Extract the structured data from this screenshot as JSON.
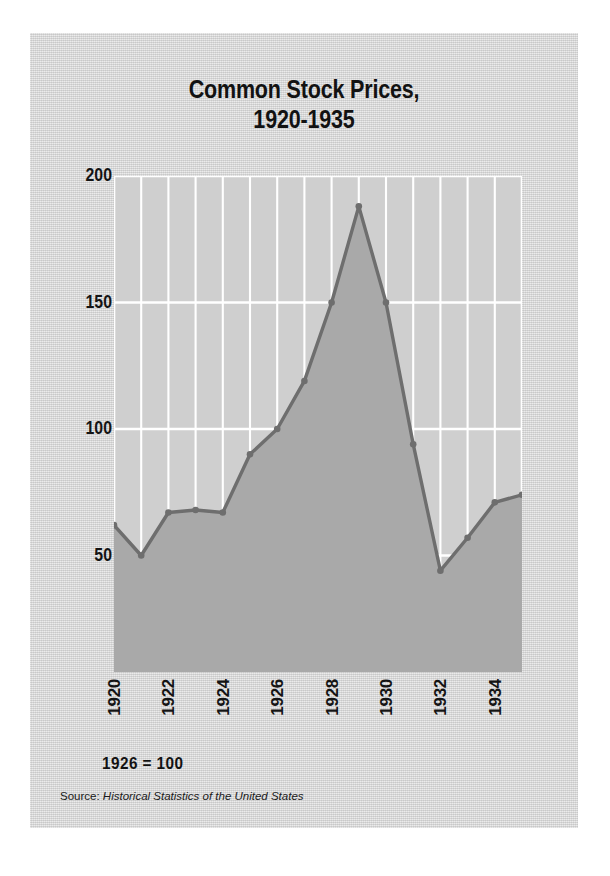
{
  "figure": {
    "title": "Common Stock Prices,\n1920-1935",
    "base_note": "1926 = 100",
    "source_label": "Source:",
    "source_title": "Historical Statistics of the United States",
    "colors": {
      "card_background": "#d4d4d4",
      "plot_background": "#cfcfcf",
      "area_fill": "#a9a9a9",
      "line": "#6e6e6e",
      "gridline": "#ffffff",
      "text": "#121212"
    }
  },
  "chart_data": {
    "type": "area",
    "title": "Common Stock Prices, 1920-1935",
    "xlabel": "",
    "ylabel": "",
    "note": "1926 = 100",
    "source": "Historical Statistics of the United States",
    "grid": true,
    "legend": "none",
    "xlim": [
      1920,
      1935
    ],
    "ylim": [
      0,
      200
    ],
    "yticks": [
      200,
      150,
      100,
      50
    ],
    "ytick_labels": [
      "200",
      "150",
      "100",
      "50"
    ],
    "xticks": [
      1920,
      1922,
      1924,
      1926,
      1928,
      1930,
      1932,
      1934
    ],
    "xtick_labels": [
      "1920",
      "1922",
      "1924",
      "1926",
      "1928",
      "1930",
      "1932",
      "1934"
    ],
    "x": [
      1920,
      1921,
      1922,
      1923,
      1924,
      1925,
      1926,
      1927,
      1928,
      1929,
      1930,
      1931,
      1932,
      1933,
      1934,
      1935
    ],
    "values": [
      62,
      50,
      67,
      68,
      67,
      90,
      100,
      119,
      150,
      188,
      150,
      94,
      44,
      57,
      71,
      74
    ],
    "series": [
      {
        "name": "Common stock price index",
        "values": [
          62,
          50,
          67,
          68,
          67,
          90,
          100,
          119,
          150,
          188,
          150,
          94,
          44,
          57,
          71,
          74
        ]
      }
    ]
  }
}
